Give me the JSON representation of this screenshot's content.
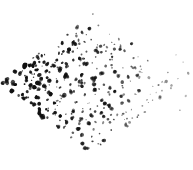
{
  "image": {
    "title": "scanned dot scatter pattern",
    "width": 193,
    "height": 170,
    "background_color": "#ffffff",
    "ink_color": "#101010",
    "description": "Hand-drawn / scanned field of small dark ink dots filling a diamond (rotated square) shaped region"
  },
  "chart_data": {
    "type": "scatter",
    "title": "",
    "subtitle": "",
    "xlabel": "",
    "ylabel": "",
    "grid": false,
    "legend": "none",
    "xlim": [
      0,
      193
    ],
    "ylim": [
      0,
      170
    ],
    "marker": {
      "shape": "irregular-blob",
      "min_radius_px": 0.8,
      "max_radius_px": 2.4,
      "color": "#101010"
    },
    "region": {
      "shape": "diamond",
      "center": [
        92,
        84
      ],
      "half_width": 93,
      "half_height": 71,
      "vertices": [
        [
          3,
          84
        ],
        [
          92,
          13
        ],
        [
          186,
          84
        ],
        [
          92,
          154
        ]
      ]
    },
    "density": {
      "model": "linear-gradient-left-to-right",
      "left_edge_relative": 1.0,
      "right_edge_relative": 0.32,
      "top_bias": 0.92,
      "bottom_bias": 0.88,
      "approx_point_count": 330
    },
    "darkness": {
      "model": "linear-gradient-left-to-right",
      "left_edge_opacity": 1.0,
      "right_edge_opacity": 0.4
    },
    "size_gradient": {
      "left_edge_scale": 1.0,
      "right_edge_scale": 0.62
    },
    "notes": [
      "Dots are densest and darkest along the left and upper-left of the diamond",
      "Dots fade to light gray and shrink toward the right vertex",
      "A few isolated outlier dots sit just beyond the right vertex near x=188",
      "Topmost dots begin near y=14; bottom-most dots end near y=152"
    ]
  }
}
